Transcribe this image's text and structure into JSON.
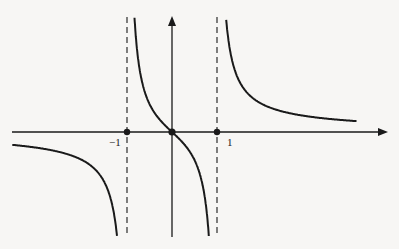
{
  "diagram": {
    "type": "function-graph",
    "function": "f(x) = x / (x^2 - 1)",
    "axes": {
      "x_arrow": true,
      "y_arrow": true
    },
    "tick_labels": [
      {
        "name": "neg-one",
        "text": "−1",
        "x": -1
      },
      {
        "name": "one",
        "text": "1",
        "x": 1
      }
    ],
    "asymptotes": [
      {
        "type": "vertical",
        "x": -1,
        "style": "dashed"
      },
      {
        "type": "vertical",
        "x": 1,
        "style": "dashed"
      },
      {
        "type": "horizontal",
        "y": 0
      }
    ],
    "points": [
      {
        "x": -1,
        "y": 0
      },
      {
        "x": 0,
        "y": 0
      },
      {
        "x": 1,
        "y": 0
      }
    ],
    "colors": {
      "ink": "#1a1a1a",
      "paper": "#f7f6f4"
    }
  }
}
